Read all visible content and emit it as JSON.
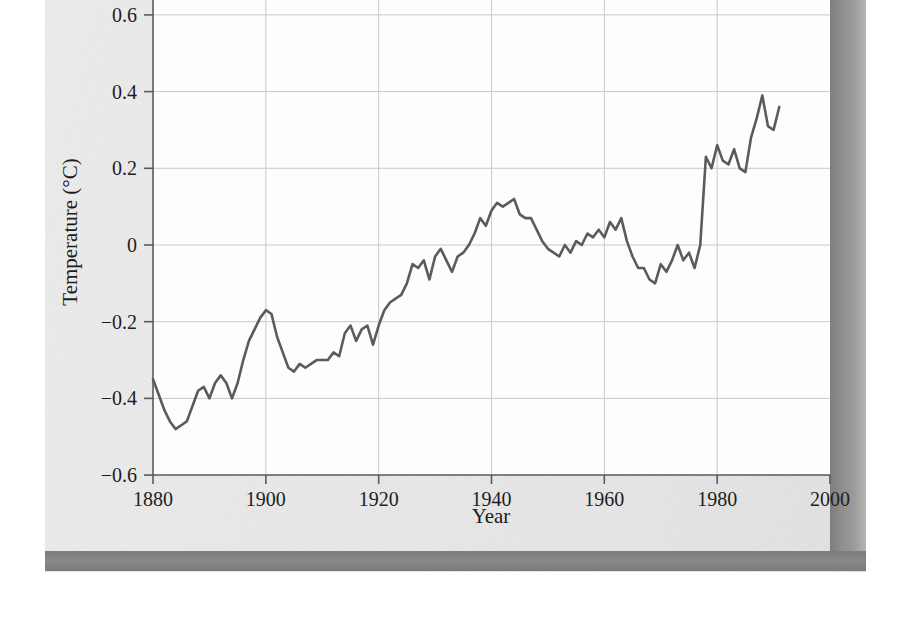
{
  "figure": {
    "kind": "scanned-textbook-line-chart",
    "page_background": "#e6e6e6",
    "plot_background": "#fdfdfd",
    "line_color": "#5b5b5b",
    "grid_color": "#c9c9c9",
    "axis_color": "#5a5a5a",
    "gutter_color": "#8d8d8d",
    "bottom_bar_color": "#828282"
  },
  "chart_data": {
    "type": "line",
    "title": "",
    "xlabel": "Year",
    "ylabel": "Temperature (°C)",
    "xlim": [
      1880,
      2000
    ],
    "ylim": [
      -0.6,
      0.6
    ],
    "xticks": [
      1880,
      1900,
      1920,
      1940,
      1960,
      1980,
      2000
    ],
    "xtick_labels": [
      "1880",
      "1900",
      "1920",
      "1940",
      "1960",
      "1980",
      "2000"
    ],
    "yticks": [
      -0.6,
      -0.4,
      -0.2,
      0,
      0.2,
      0.4,
      0.6
    ],
    "ytick_labels": [
      "−0.6",
      "−0.4",
      "−0.2",
      "0",
      "0.2",
      "0.4",
      "0.6"
    ],
    "grid": true,
    "legend": null,
    "series": [
      {
        "name": "Global mean temperature anomaly",
        "x": [
          1880,
          1881,
          1882,
          1883,
          1884,
          1885,
          1886,
          1887,
          1888,
          1889,
          1890,
          1891,
          1892,
          1893,
          1894,
          1895,
          1896,
          1897,
          1898,
          1899,
          1900,
          1901,
          1902,
          1903,
          1904,
          1905,
          1906,
          1907,
          1908,
          1909,
          1910,
          1911,
          1912,
          1913,
          1914,
          1915,
          1916,
          1917,
          1918,
          1919,
          1920,
          1921,
          1922,
          1923,
          1924,
          1925,
          1926,
          1927,
          1928,
          1929,
          1930,
          1931,
          1932,
          1933,
          1934,
          1935,
          1936,
          1937,
          1938,
          1939,
          1940,
          1941,
          1942,
          1943,
          1944,
          1945,
          1946,
          1947,
          1948,
          1949,
          1950,
          1951,
          1952,
          1953,
          1954,
          1955,
          1956,
          1957,
          1958,
          1959,
          1960,
          1961,
          1962,
          1963,
          1964,
          1965,
          1966,
          1967,
          1968,
          1969,
          1970,
          1971,
          1972,
          1973,
          1974,
          1975,
          1976,
          1977,
          1978,
          1979,
          1980,
          1981,
          1982,
          1983,
          1984,
          1985,
          1986,
          1987,
          1988,
          1989,
          1990,
          1991
        ],
        "values": [
          -0.35,
          -0.39,
          -0.43,
          -0.46,
          -0.48,
          -0.47,
          -0.46,
          -0.42,
          -0.38,
          -0.37,
          -0.4,
          -0.36,
          -0.34,
          -0.36,
          -0.4,
          -0.36,
          -0.3,
          -0.25,
          -0.22,
          -0.19,
          -0.17,
          -0.18,
          -0.24,
          -0.28,
          -0.32,
          -0.33,
          -0.31,
          -0.32,
          -0.31,
          -0.3,
          -0.3,
          -0.3,
          -0.28,
          -0.29,
          -0.23,
          -0.21,
          -0.25,
          -0.22,
          -0.21,
          -0.26,
          -0.21,
          -0.17,
          -0.15,
          -0.14,
          -0.13,
          -0.1,
          -0.05,
          -0.06,
          -0.04,
          -0.09,
          -0.03,
          -0.01,
          -0.04,
          -0.07,
          -0.03,
          -0.02,
          0.0,
          0.03,
          0.07,
          0.05,
          0.09,
          0.11,
          0.1,
          0.11,
          0.12,
          0.08,
          0.07,
          0.07,
          0.04,
          0.01,
          -0.01,
          -0.02,
          -0.03,
          0.0,
          -0.02,
          0.01,
          0.0,
          0.03,
          0.02,
          0.04,
          0.02,
          0.06,
          0.04,
          0.07,
          0.01,
          -0.03,
          -0.06,
          -0.06,
          -0.09,
          -0.1,
          -0.05,
          -0.07,
          -0.04,
          0.0,
          -0.04,
          -0.02,
          -0.06,
          0.0,
          0.23,
          0.2,
          0.26,
          0.22,
          0.21,
          0.25,
          0.2,
          0.19,
          0.28,
          0.33,
          0.39,
          0.31,
          0.3,
          0.36
        ]
      }
    ]
  }
}
